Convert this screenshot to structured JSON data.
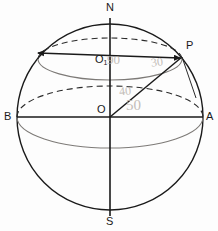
{
  "figure": {
    "kind": "sphere-latitude-longitude-diagram",
    "background_color": "#fdfdfd",
    "ink_color": "#1a1a1a",
    "pencil_color": "#b9b3ad",
    "sphere": {
      "center_x": 110,
      "center_y": 117,
      "radius": 93
    }
  },
  "labels": {
    "north_pole": "N",
    "south_pole": "S",
    "right_equator": "A",
    "left_equator": "B",
    "point_p": "P",
    "center": "O",
    "parallel_center": "O",
    "parallel_center_subscript": "1"
  },
  "annotations": {
    "ninety": "90",
    "thirty": "30",
    "forty": "40",
    "fifty": "50"
  }
}
